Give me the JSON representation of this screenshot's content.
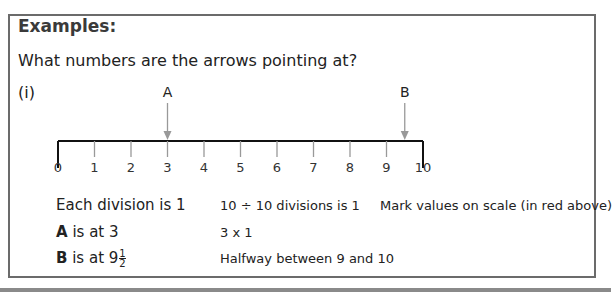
{
  "title": "Examples:",
  "question": "What numbers are the arrows pointing at?",
  "part_label": "(i)",
  "scale": {
    "min": 0,
    "max": 10,
    "tick_labels": [
      "0",
      "1",
      "2",
      "3",
      "4",
      "5",
      "6",
      "7",
      "8",
      "9",
      "10"
    ],
    "arrows": [
      {
        "label": "A",
        "value": 3
      },
      {
        "label": "B",
        "value": 9.5
      }
    ]
  },
  "rows": [
    {
      "left": "Each division is 1",
      "mid": "10 ÷ 10 divisions is 1",
      "right": "Mark values on scale (in red above)"
    },
    {
      "left_bold": "A",
      "left_rest": " is at 3",
      "mid": "3 x 1"
    },
    {
      "left_bold": "B",
      "left_rest": " is at 9",
      "frac_num": "1",
      "frac_den": "2",
      "mid": "Halfway between 9 and 10"
    }
  ]
}
